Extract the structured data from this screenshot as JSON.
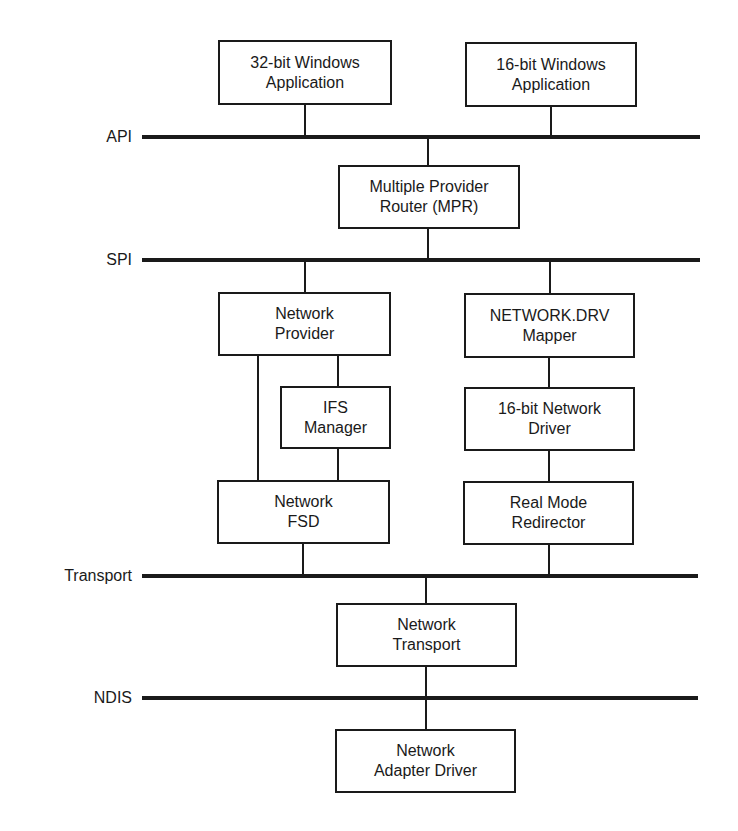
{
  "diagram": {
    "buses": {
      "api": "API",
      "spi": "SPI",
      "transport": "Transport",
      "ndis": "NDIS"
    },
    "components": {
      "app32": [
        "32-bit Windows",
        "Application"
      ],
      "app16": [
        "16-bit Windows",
        "Application"
      ],
      "mpr": [
        "Multiple Provider",
        "Router (MPR)"
      ],
      "network_provider": [
        "Network",
        "Provider"
      ],
      "ifs_manager": [
        "IFS",
        "Manager"
      ],
      "network_fsd": [
        "Network",
        "FSD"
      ],
      "network_drv_mapper": [
        "NETWORK.DRV",
        "Mapper"
      ],
      "net_driver_16": [
        "16-bit Network",
        "Driver"
      ],
      "real_mode_redirector": [
        "Real Mode",
        "Redirector"
      ],
      "network_transport": [
        "Network",
        "Transport"
      ],
      "network_adapter_driver": [
        "Network",
        "Adapter Driver"
      ]
    },
    "connections": [
      [
        "app32",
        "api"
      ],
      [
        "app16",
        "api"
      ],
      [
        "api",
        "mpr"
      ],
      [
        "mpr",
        "spi"
      ],
      [
        "spi",
        "network_provider"
      ],
      [
        "spi",
        "network_drv_mapper"
      ],
      [
        "network_provider",
        "ifs_manager"
      ],
      [
        "network_provider",
        "network_fsd"
      ],
      [
        "ifs_manager",
        "network_fsd"
      ],
      [
        "network_drv_mapper",
        "net_driver_16"
      ],
      [
        "net_driver_16",
        "real_mode_redirector"
      ],
      [
        "network_fsd",
        "transport"
      ],
      [
        "real_mode_redirector",
        "transport"
      ],
      [
        "transport",
        "network_transport"
      ],
      [
        "network_transport",
        "ndis"
      ],
      [
        "ndis",
        "network_adapter_driver"
      ]
    ]
  }
}
